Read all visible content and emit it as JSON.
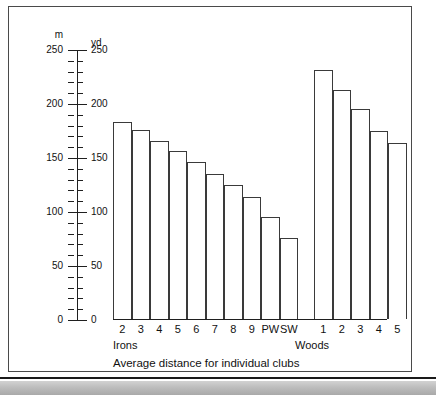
{
  "figure": {
    "caption": "Average distance for individual clubs",
    "group_labels": {
      "irons": "Irons",
      "woods": "Woods"
    },
    "axis_units": {
      "left": "m",
      "right": "yd"
    }
  },
  "chart_data": {
    "type": "bar",
    "title": "Average distance for individual clubs",
    "xlabel": "",
    "ylabel": "yd",
    "secondary_ylabel": "m",
    "ylim": [
      0,
      250
    ],
    "secondary_ylim": [
      0,
      250
    ],
    "grid": false,
    "legend": null,
    "groups": [
      {
        "name": "Irons",
        "categories": [
          "2",
          "3",
          "4",
          "5",
          "6",
          "7",
          "8",
          "9",
          "PW",
          "SW"
        ],
        "values": [
          182,
          175,
          165,
          156,
          145,
          134,
          124,
          113,
          94,
          75
        ]
      },
      {
        "name": "Woods",
        "categories": [
          "1",
          "2",
          "3",
          "4",
          "5"
        ],
        "values": [
          231,
          212,
          194,
          174,
          163
        ]
      }
    ],
    "categories": [
      "2",
      "3",
      "4",
      "5",
      "6",
      "7",
      "8",
      "9",
      "PW",
      "SW",
      "1",
      "2",
      "3",
      "4",
      "5"
    ],
    "values": [
      182,
      175,
      165,
      156,
      145,
      134,
      124,
      113,
      94,
      75,
      231,
      212,
      194,
      174,
      163
    ],
    "units": "yards",
    "axis_left": {
      "unit": "m",
      "major_ticks": [
        0,
        50,
        100,
        150,
        200,
        250
      ],
      "minor_tick_step": 10,
      "tick_labels": [
        "0",
        "50",
        "100",
        "150",
        "200",
        "250"
      ]
    },
    "axis_right": {
      "unit": "yd",
      "major_ticks": [
        0,
        50,
        100,
        150,
        200,
        250
      ],
      "minor_tick_step": 10,
      "tick_labels": [
        "0",
        "50",
        "100",
        "150",
        "200",
        "250"
      ]
    }
  }
}
